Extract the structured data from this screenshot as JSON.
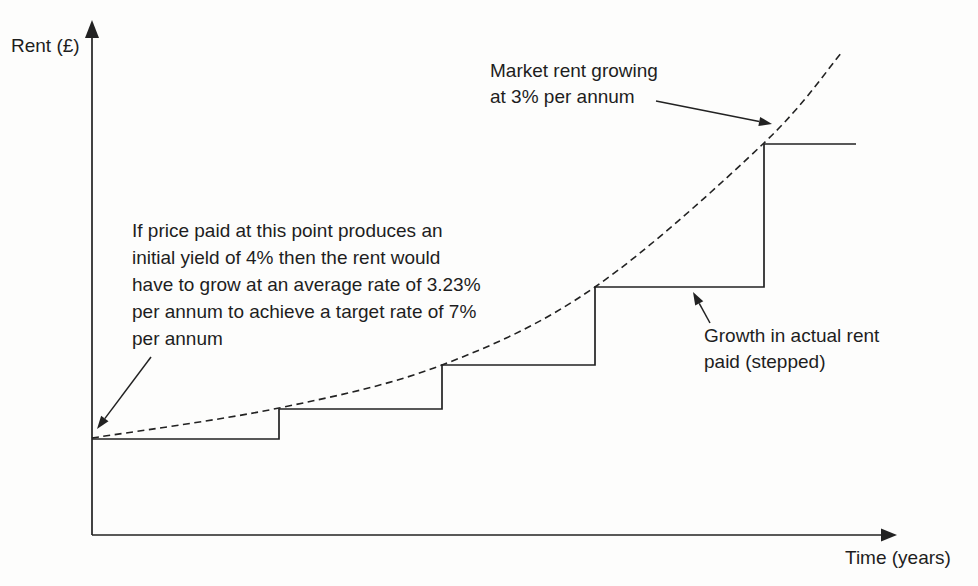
{
  "colors": {
    "ink": "#222222",
    "background": "#fdfdfc"
  },
  "chart_data": {
    "type": "line",
    "title": "",
    "xlabel": "Time (years)",
    "ylabel": "Rent (£)",
    "grid": false,
    "axis_tick_labels": "none (conceptual diagram, unlabeled axes)",
    "units": "pixel coordinates on 978x586 canvas, y increases downward",
    "axes": {
      "origin": [
        92,
        535
      ],
      "x_tip": [
        897,
        535
      ],
      "y_tip": [
        92,
        20
      ]
    },
    "ylabel_pos": [
      11,
      33
    ],
    "xlabel_pos": [
      845,
      545
    ],
    "series": [
      {
        "name": "Market rent growing at 3% per annum",
        "type": "smooth-curve",
        "line_style": "dashed",
        "points": [
          [
            92,
            438
          ],
          [
            279,
            408
          ],
          [
            442,
            365
          ],
          [
            595,
            287
          ],
          [
            764,
            143
          ],
          [
            842,
            52
          ]
        ]
      },
      {
        "name": "Growth in actual rent paid (stepped)",
        "type": "step",
        "line_style": "solid",
        "step_levels": [
          {
            "y": 439,
            "x_start": 92,
            "x_end": 279
          },
          {
            "y": 409,
            "x_start": 279,
            "x_end": 442
          },
          {
            "y": 365,
            "x_start": 442,
            "x_end": 595
          },
          {
            "y": 287,
            "x_start": 595,
            "x_end": 764
          },
          {
            "y": 144,
            "x_start": 764,
            "x_end": 856
          }
        ]
      }
    ],
    "annotations": [
      {
        "id": "market-rent-label",
        "text": "Market rent growing\nat 3% per annum",
        "x": 490,
        "y": 58,
        "arrow": {
          "x1": 656,
          "y1": 101,
          "x2": 772,
          "y2": 124
        }
      },
      {
        "id": "price-yield-note",
        "text": "If price paid at this point produces an\ninitial yield of 4% then the rent would\nhave to grow at an average rate of 3.23%\nper annum to achieve a target rate of 7%\nper annum",
        "x": 132,
        "y": 217,
        "arrow": {
          "x1": 151,
          "y1": 357,
          "x2": 97,
          "y2": 429
        }
      },
      {
        "id": "actual-rent-label",
        "text": "Growth in actual rent\npaid (stepped)",
        "x": 704,
        "y": 323,
        "arrow": {
          "x1": 710,
          "y1": 323,
          "x2": 693,
          "y2": 292
        }
      }
    ]
  }
}
